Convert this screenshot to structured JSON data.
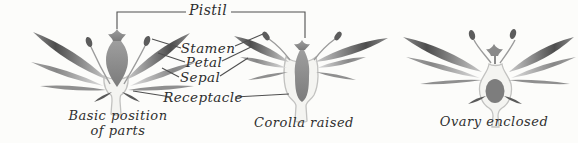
{
  "figure": {
    "title_implied": "Flower parts diagram",
    "colors": {
      "paper": "#fcfcfa",
      "ink": "#2d2d2d",
      "leader_line": "#4f4f4f",
      "petal_dark": "#4d4d4d",
      "sepal_gray": "#8d8d8d",
      "receptacle_outline": "#c2c2c0"
    },
    "pistil_label": "Pistil",
    "labels": {
      "stamen": "Stamen",
      "petal": "Petal",
      "sepal": "Sepal",
      "receptacle": "Receptacle"
    },
    "captions": {
      "flower1_line1": "Basic position",
      "flower1_line2": "of parts",
      "flower2": "Corolla raised",
      "flower3": "Ovary enclosed"
    }
  }
}
